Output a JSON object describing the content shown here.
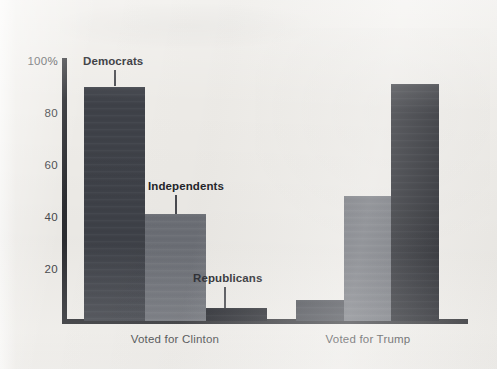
{
  "chart_data": {
    "type": "bar",
    "title": "",
    "subtitle": "",
    "xlabel": "",
    "ylabel": "",
    "ylim": [
      0,
      100
    ],
    "grid": false,
    "legend_position": "inline-callout",
    "categories": [
      "Voted for Clinton",
      "Voted for Trump"
    ],
    "ytick_labels": [
      "100%",
      "80",
      "60",
      "40",
      "20"
    ],
    "ytick_values": [
      100,
      80,
      60,
      40,
      20
    ],
    "series": [
      {
        "name": "Democrats",
        "color": "#3f4249",
        "values": [
          90,
          8
        ]
      },
      {
        "name": "Independents",
        "color": "#6e7178",
        "values": [
          41,
          48
        ]
      },
      {
        "name": "Republicans",
        "color": "#1f2127",
        "values": [
          5,
          91
        ]
      }
    ],
    "annotations": [
      {
        "text": "Democrats",
        "series": "Democrats",
        "group": "Voted for Clinton"
      },
      {
        "text": "Independents",
        "series": "Independents",
        "group": "Voted for Clinton"
      },
      {
        "text": "Republicans",
        "series": "Republicans",
        "group": "Voted for Clinton"
      }
    ]
  },
  "axis": {
    "y_ticks": [
      {
        "label": "100%"
      },
      {
        "label": "80"
      },
      {
        "label": "60"
      },
      {
        "label": "40"
      },
      {
        "label": "20"
      }
    ]
  },
  "groups": [
    {
      "label": "Voted for Clinton"
    },
    {
      "label": "Voted for Trump"
    }
  ],
  "callouts": [
    {
      "label": "Democrats"
    },
    {
      "label": "Independents"
    },
    {
      "label": "Republicans"
    }
  ]
}
